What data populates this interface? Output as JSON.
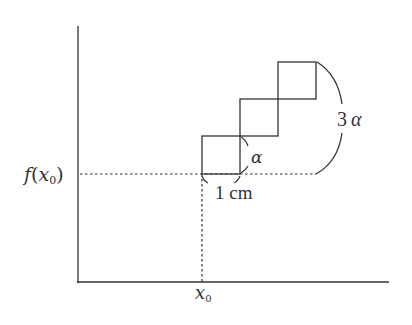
{
  "diagram": {
    "labels": {
      "y_label_f": "f",
      "y_label_paren_open": "(",
      "y_label_x": "x",
      "y_label_sub": "0",
      "y_label_paren_close": ")",
      "x_label_x": "x",
      "x_label_sub": "0",
      "side_label": "α",
      "total_label_num": "3",
      "total_label_alpha": "α",
      "width_label": "1 cm"
    },
    "squares": [
      {
        "x": 202,
        "y": 136,
        "size": 38
      },
      {
        "x": 240,
        "y": 99,
        "size": 37
      },
      {
        "x": 278,
        "y": 62,
        "size": 37
      }
    ],
    "colors": {
      "line": "#333333",
      "text": "#333333"
    }
  }
}
